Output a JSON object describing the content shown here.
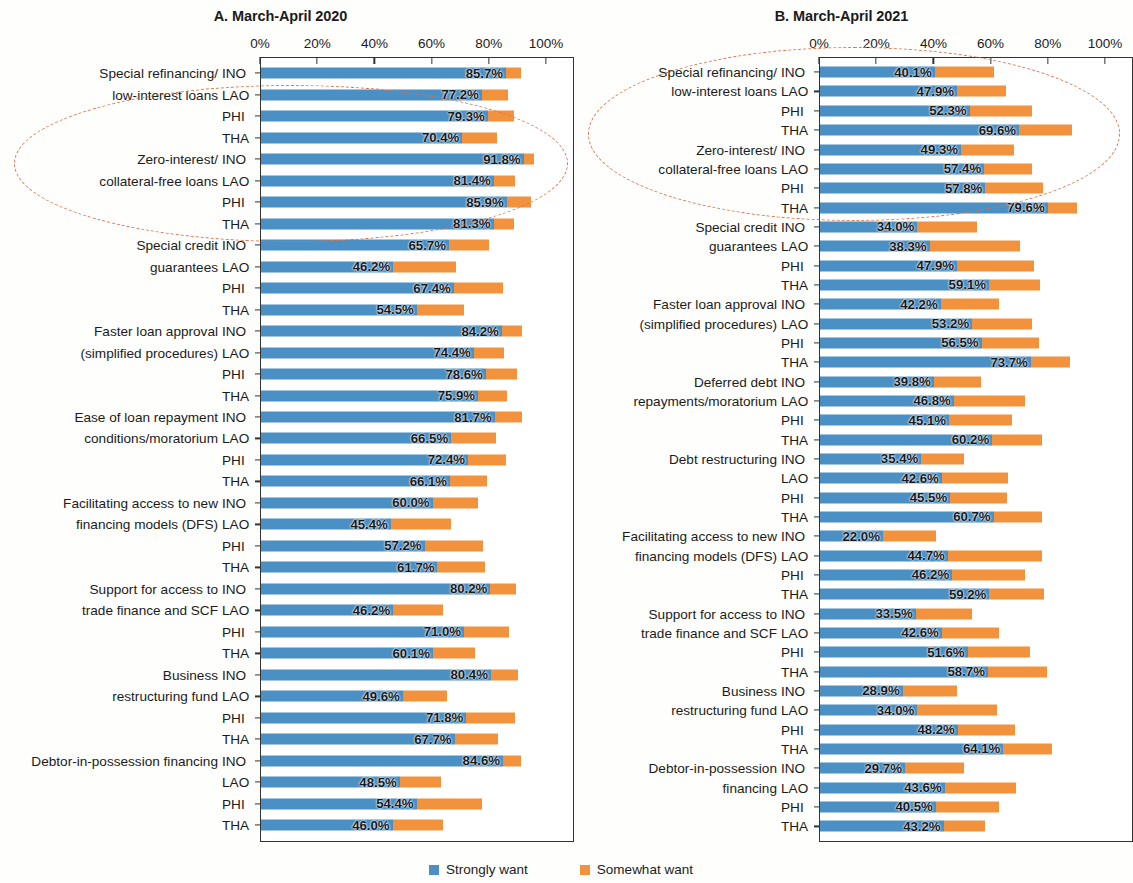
{
  "figure": {
    "legend": [
      {
        "label": "Strongly want",
        "color": "#4A90C4"
      },
      {
        "label": "Somewhat want",
        "color": "#F3923D"
      }
    ],
    "colors": {
      "strongly_want": "#4A90C4",
      "somewhat_want": "#F3923D",
      "highlight_ellipse": "#E0714A",
      "axis": "#333333"
    },
    "axis_ticks": [
      "0%",
      "20%",
      "40%",
      "60%",
      "80%",
      "100%"
    ],
    "economies": [
      "INO",
      "LAO",
      "PHI",
      "THA"
    ]
  },
  "chart_data": [
    {
      "type": "bar",
      "title": "A. March-April 2020",
      "orientation": "horizontal",
      "stacked": true,
      "xlabel": "",
      "ylabel": "",
      "xlim": [
        0,
        100
      ],
      "grid": false,
      "legend_position": "bottom-center",
      "tick_labels": [
        "0%",
        "20%",
        "40%",
        "60%",
        "80%",
        "100%"
      ],
      "series": [
        {
          "name": "Strongly want",
          "color": "#4A90C4"
        },
        {
          "name": "Somewhat want",
          "color": "#F3923D"
        }
      ],
      "groups": [
        {
          "category": "Special refinancing/ low-interest loans",
          "category_lines": [
            "Special refinancing/",
            "low-interest loans"
          ],
          "rows": [
            {
              "economy": "INO",
              "strongly_want": 85.7,
              "somewhat_want": 5.1,
              "label": "85.7%"
            },
            {
              "economy": "LAO",
              "strongly_want": 77.2,
              "somewhat_want": 9.2,
              "label": "77.2%"
            },
            {
              "economy": "PHI",
              "strongly_want": 79.3,
              "somewhat_want": 9.0,
              "label": "79.3%"
            },
            {
              "economy": "THA",
              "strongly_want": 70.4,
              "somewhat_want": 12.1,
              "label": "70.4%"
            }
          ]
        },
        {
          "category": "Zero-interest/ collateral-free loans",
          "category_lines": [
            "Zero-interest/",
            "collateral-free loans"
          ],
          "rows": [
            {
              "economy": "INO",
              "strongly_want": 91.8,
              "somewhat_want": 3.6,
              "label": "91.8%"
            },
            {
              "economy": "LAO",
              "strongly_want": 81.4,
              "somewhat_want": 7.4,
              "label": "81.4%"
            },
            {
              "economy": "PHI",
              "strongly_want": 85.9,
              "somewhat_want": 8.6,
              "label": "85.9%"
            },
            {
              "economy": "THA",
              "strongly_want": 81.3,
              "somewhat_want": 7.2,
              "label": "81.3%"
            }
          ]
        },
        {
          "category": "Special credit guarantees",
          "category_lines": [
            "Special credit",
            "guarantees"
          ],
          "rows": [
            {
              "economy": "INO",
              "strongly_want": 65.7,
              "somewhat_want": 14.0,
              "label": "65.7%"
            },
            {
              "economy": "LAO",
              "strongly_want": 46.2,
              "somewhat_want": 22.0,
              "label": "46.2%"
            },
            {
              "economy": "PHI",
              "strongly_want": 67.4,
              "somewhat_want": 17.2,
              "label": "67.4%"
            },
            {
              "economy": "THA",
              "strongly_want": 54.5,
              "somewhat_want": 16.6,
              "label": "54.5%"
            }
          ]
        },
        {
          "category": "Faster loan approval (simplified procedures)",
          "category_lines": [
            "Faster loan approval",
            "(simplified procedures)"
          ],
          "rows": [
            {
              "economy": "INO",
              "strongly_want": 84.2,
              "somewhat_want": 7.0,
              "label": "84.2%"
            },
            {
              "economy": "LAO",
              "strongly_want": 74.4,
              "somewhat_want": 10.5,
              "label": "74.4%"
            },
            {
              "economy": "PHI",
              "strongly_want": 78.6,
              "somewhat_want": 10.9,
              "label": "78.6%"
            },
            {
              "economy": "THA",
              "strongly_want": 75.9,
              "somewhat_want": 10.1,
              "label": "75.9%"
            }
          ]
        },
        {
          "category": "Ease of loan repayment conditions/moratorium",
          "category_lines": [
            "Ease of loan repayment",
            "conditions/moratorium"
          ],
          "rows": [
            {
              "economy": "INO",
              "strongly_want": 81.7,
              "somewhat_want": 9.4,
              "label": "81.7%"
            },
            {
              "economy": "LAO",
              "strongly_want": 66.5,
              "somewhat_want": 15.5,
              "label": "66.5%"
            },
            {
              "economy": "PHI",
              "strongly_want": 72.4,
              "somewhat_want": 13.3,
              "label": "72.4%"
            },
            {
              "economy": "THA",
              "strongly_want": 66.1,
              "somewhat_want": 12.9,
              "label": "66.1%"
            }
          ]
        },
        {
          "category": "Facilitating access to new financing models (DFS)",
          "category_lines": [
            "Facilitating access to new",
            "financing models (DFS)"
          ],
          "rows": [
            {
              "economy": "INO",
              "strongly_want": 60.0,
              "somewhat_want": 16.0,
              "label": "60.0%"
            },
            {
              "economy": "LAO",
              "strongly_want": 45.4,
              "somewhat_want": 21.0,
              "label": "45.4%"
            },
            {
              "economy": "PHI",
              "strongly_want": 57.2,
              "somewhat_want": 20.3,
              "label": "57.2%"
            },
            {
              "economy": "THA",
              "strongly_want": 61.7,
              "somewhat_want": 16.6,
              "label": "61.7%"
            }
          ]
        },
        {
          "category": "Support for access to trade finance and SCF",
          "category_lines": [
            "Support for access to",
            "trade finance and SCF"
          ],
          "rows": [
            {
              "economy": "INO",
              "strongly_want": 80.2,
              "somewhat_want": 9.0,
              "label": "80.2%"
            },
            {
              "economy": "LAO",
              "strongly_want": 46.2,
              "somewhat_want": 17.5,
              "label": "46.2%"
            },
            {
              "economy": "PHI",
              "strongly_want": 71.0,
              "somewhat_want": 15.8,
              "label": "71.0%"
            },
            {
              "economy": "THA",
              "strongly_want": 60.1,
              "somewhat_want": 14.8,
              "label": "60.1%"
            }
          ]
        },
        {
          "category": "Business restructuring fund",
          "category_lines": [
            "Business",
            "restructuring fund"
          ],
          "rows": [
            {
              "economy": "INO",
              "strongly_want": 80.4,
              "somewhat_want": 9.6,
              "label": "80.4%"
            },
            {
              "economy": "LAO",
              "strongly_want": 49.6,
              "somewhat_want": 15.5,
              "label": "49.6%"
            },
            {
              "economy": "PHI",
              "strongly_want": 71.8,
              "somewhat_want": 17.0,
              "label": "71.8%"
            },
            {
              "economy": "THA",
              "strongly_want": 67.7,
              "somewhat_want": 15.0,
              "label": "67.7%"
            }
          ]
        },
        {
          "category": "Debtor-in-possession financing",
          "category_lines": [
            "Debtor-in-possession financing",
            ""
          ],
          "rows": [
            {
              "economy": "INO",
              "strongly_want": 84.6,
              "somewhat_want": 6.4,
              "label": "84.6%"
            },
            {
              "economy": "LAO",
              "strongly_want": 48.5,
              "somewhat_want": 14.6,
              "label": "48.5%"
            },
            {
              "economy": "PHI",
              "strongly_want": 54.4,
              "somewhat_want": 23.0,
              "label": "54.4%"
            },
            {
              "economy": "THA",
              "strongly_want": 46.0,
              "somewhat_want": 17.5,
              "label": "46.0%"
            }
          ]
        }
      ]
    },
    {
      "type": "bar",
      "title": "B. March-April 2021",
      "orientation": "horizontal",
      "stacked": true,
      "xlabel": "",
      "ylabel": "",
      "xlim": [
        0,
        100
      ],
      "grid": false,
      "legend_position": "bottom-center",
      "tick_labels": [
        "0%",
        "20%",
        "40%",
        "60%",
        "80%",
        "100%"
      ],
      "series": [
        {
          "name": "Strongly want",
          "color": "#4A90C4"
        },
        {
          "name": "Somewhat want",
          "color": "#F3923D"
        }
      ],
      "groups": [
        {
          "category": "Special refinancing/ low-interest loans",
          "category_lines": [
            "Special refinancing/",
            "low-interest loans"
          ],
          "rows": [
            {
              "economy": "INO",
              "strongly_want": 40.1,
              "somewhat_want": 20.9,
              "label": "40.1%"
            },
            {
              "economy": "LAO",
              "strongly_want": 47.9,
              "somewhat_want": 17.0,
              "label": "47.9%"
            },
            {
              "economy": "PHI",
              "strongly_want": 52.3,
              "somewhat_want": 21.7,
              "label": "52.3%"
            },
            {
              "economy": "THA",
              "strongly_want": 69.6,
              "somewhat_want": 18.4,
              "label": "69.6%"
            }
          ]
        },
        {
          "category": "Zero-interest/ collateral-free loans",
          "category_lines": [
            "Zero-interest/",
            "collateral-free loans"
          ],
          "rows": [
            {
              "economy": "INO",
              "strongly_want": 49.3,
              "somewhat_want": 18.7,
              "label": "49.3%"
            },
            {
              "economy": "LAO",
              "strongly_want": 57.4,
              "somewhat_want": 16.6,
              "label": "57.4%"
            },
            {
              "economy": "PHI",
              "strongly_want": 57.8,
              "somewhat_want": 20.2,
              "label": "57.8%"
            },
            {
              "economy": "THA",
              "strongly_want": 79.6,
              "somewhat_want": 10.4,
              "label": "79.6%"
            }
          ]
        },
        {
          "category": "Special credit guarantees",
          "category_lines": [
            "Special credit",
            "guarantees"
          ],
          "rows": [
            {
              "economy": "INO",
              "strongly_want": 34.0,
              "somewhat_want": 21.0,
              "label": "34.0%"
            },
            {
              "economy": "LAO",
              "strongly_want": 38.3,
              "somewhat_want": 31.5,
              "label": "38.3%"
            },
            {
              "economy": "PHI",
              "strongly_want": 47.9,
              "somewhat_want": 27.0,
              "label": "47.9%"
            },
            {
              "economy": "THA",
              "strongly_want": 59.1,
              "somewhat_want": 18.0,
              "label": "59.1%"
            }
          ]
        },
        {
          "category": "Faster loan approval (simplified procedures)",
          "category_lines": [
            "Faster loan approval",
            "(simplified procedures)"
          ],
          "rows": [
            {
              "economy": "INO",
              "strongly_want": 42.2,
              "somewhat_want": 20.3,
              "label": "42.2%"
            },
            {
              "economy": "LAO",
              "strongly_want": 53.2,
              "somewhat_want": 20.8,
              "label": "53.2%"
            },
            {
              "economy": "PHI",
              "strongly_want": 56.5,
              "somewhat_want": 20.0,
              "label": "56.5%"
            },
            {
              "economy": "THA",
              "strongly_want": 73.7,
              "somewhat_want": 13.7,
              "label": "73.7%"
            }
          ]
        },
        {
          "category": "Deferred debt repayments/moratorium",
          "category_lines": [
            "Deferred debt",
            "repayments/moratorium"
          ],
          "rows": [
            {
              "economy": "INO",
              "strongly_want": 39.8,
              "somewhat_want": 16.5,
              "label": "39.8%"
            },
            {
              "economy": "LAO",
              "strongly_want": 46.8,
              "somewhat_want": 25.0,
              "label": "46.8%"
            },
            {
              "economy": "PHI",
              "strongly_want": 45.1,
              "somewhat_want": 22.0,
              "label": "45.1%"
            },
            {
              "economy": "THA",
              "strongly_want": 60.2,
              "somewhat_want": 17.5,
              "label": "60.2%"
            }
          ]
        },
        {
          "category": "Debt restructuring",
          "category_lines": [
            "Debt restructuring",
            ""
          ],
          "rows": [
            {
              "economy": "INO",
              "strongly_want": 35.4,
              "somewhat_want": 15.0,
              "label": "35.4%"
            },
            {
              "economy": "LAO",
              "strongly_want": 42.6,
              "somewhat_want": 23.0,
              "label": "42.6%"
            },
            {
              "economy": "PHI",
              "strongly_want": 45.5,
              "somewhat_want": 20.0,
              "label": "45.5%"
            },
            {
              "economy": "THA",
              "strongly_want": 60.7,
              "somewhat_want": 17.0,
              "label": "60.7%"
            }
          ]
        },
        {
          "category": "Facilitating access to new financing models (DFS)",
          "category_lines": [
            "Facilitating access to new",
            "financing models (DFS)"
          ],
          "rows": [
            {
              "economy": "INO",
              "strongly_want": 22.0,
              "somewhat_want": 18.5,
              "label": "22.0%"
            },
            {
              "economy": "LAO",
              "strongly_want": 44.7,
              "somewhat_want": 33.0,
              "label": "44.7%"
            },
            {
              "economy": "PHI",
              "strongly_want": 46.2,
              "somewhat_want": 25.5,
              "label": "46.2%"
            },
            {
              "economy": "THA",
              "strongly_want": 59.2,
              "somewhat_want": 19.0,
              "label": "59.2%"
            }
          ]
        },
        {
          "category": "Support for access to trade finance and SCF",
          "category_lines": [
            "Support for access to",
            "trade finance and SCF"
          ],
          "rows": [
            {
              "economy": "INO",
              "strongly_want": 33.5,
              "somewhat_want": 19.5,
              "label": "33.5%"
            },
            {
              "economy": "LAO",
              "strongly_want": 42.6,
              "somewhat_want": 20.0,
              "label": "42.6%"
            },
            {
              "economy": "PHI",
              "strongly_want": 51.6,
              "somewhat_want": 22.0,
              "label": "51.6%"
            },
            {
              "economy": "THA",
              "strongly_want": 58.7,
              "somewhat_want": 20.5,
              "label": "58.7%"
            }
          ]
        },
        {
          "category": "Business restructuring fund",
          "category_lines": [
            "Business",
            "restructuring fund"
          ],
          "rows": [
            {
              "economy": "INO",
              "strongly_want": 28.9,
              "somewhat_want": 19.0,
              "label": "28.9%"
            },
            {
              "economy": "LAO",
              "strongly_want": 34.0,
              "somewhat_want": 28.0,
              "label": "34.0%"
            },
            {
              "economy": "PHI",
              "strongly_want": 48.2,
              "somewhat_want": 20.0,
              "label": "48.2%"
            },
            {
              "economy": "THA",
              "strongly_want": 64.1,
              "somewhat_want": 17.0,
              "label": "64.1%"
            }
          ]
        },
        {
          "category": "Debtor-in-possession financing",
          "category_lines": [
            "Debtor-in-possession",
            "financing"
          ],
          "rows": [
            {
              "economy": "INO",
              "strongly_want": 29.7,
              "somewhat_want": 20.5,
              "label": "29.7%"
            },
            {
              "economy": "LAO",
              "strongly_want": 43.6,
              "somewhat_want": 25.0,
              "label": "43.6%"
            },
            {
              "economy": "PHI",
              "strongly_want": 40.5,
              "somewhat_want": 22.0,
              "label": "40.5%"
            },
            {
              "economy": "THA",
              "strongly_want": 43.2,
              "somewhat_want": 14.5,
              "label": "43.2%"
            }
          ]
        }
      ]
    }
  ]
}
